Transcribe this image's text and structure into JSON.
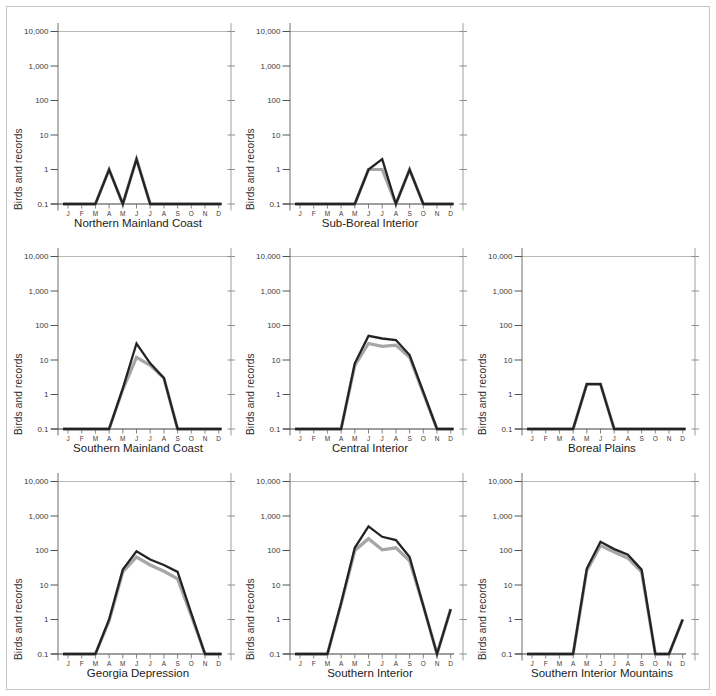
{
  "figure_name": "seasonal-occurrence-panels",
  "colors": {
    "black_line": "#232323",
    "gray_line": "#a6a6a6",
    "axis": "#6f6f6f",
    "right_axis": "#a0a0a0",
    "top_rule": "#b8b8b8",
    "frame_border": "#c6c6c6",
    "tick_text": "#3a3a3a"
  },
  "chart_data": {
    "type": "line",
    "yscale": "log",
    "ylim": [
      0.1,
      10000
    ],
    "ylabel": "Birds and records",
    "xlabel": "",
    "categories": [
      "J",
      "F",
      "M",
      "A",
      "M",
      "J",
      "J",
      "A",
      "S",
      "O",
      "N",
      "D"
    ],
    "ytick_labels": [
      "10,000",
      "1,000",
      "100",
      "10",
      "1",
      "0.1"
    ],
    "ytick_values": [
      10000,
      1000,
      100,
      10,
      1,
      0.1
    ],
    "grid": "off",
    "legend": "none",
    "charts": [
      {
        "title": "Northern Mainland Coast",
        "grid_pos": {
          "row": 1,
          "col": 1
        },
        "series": [
          {
            "name": "gray-series",
            "color": "#a6a6a6",
            "values": [
              0.1,
              0.1,
              0.1,
              1,
              0.1,
              2,
              0.1,
              0.1,
              0.1,
              0.1,
              0.1,
              0.1
            ]
          },
          {
            "name": "black-series",
            "color": "#232323",
            "values": [
              0.1,
              0.1,
              0.1,
              1,
              0.1,
              2,
              0.1,
              0.1,
              0.1,
              0.1,
              0.1,
              0.1
            ]
          }
        ]
      },
      {
        "title": "Sub-Boreal Interior",
        "grid_pos": {
          "row": 1,
          "col": 2
        },
        "series": [
          {
            "name": "gray-series",
            "color": "#a6a6a6",
            "values": [
              0.1,
              0.1,
              0.1,
              0.1,
              0.1,
              1,
              1,
              0.1,
              1,
              0.1,
              0.1,
              0.1
            ]
          },
          {
            "name": "black-series",
            "color": "#232323",
            "values": [
              0.1,
              0.1,
              0.1,
              0.1,
              0.1,
              1,
              2,
              0.1,
              1,
              0.1,
              0.1,
              0.1
            ]
          }
        ]
      },
      {
        "title": "Southern Mainland Coast",
        "grid_pos": {
          "row": 2,
          "col": 1
        },
        "series": [
          {
            "name": "gray-series",
            "color": "#a6a6a6",
            "values": [
              0.1,
              0.1,
              0.1,
              0.1,
              1.4,
              12,
              7,
              3,
              0.1,
              0.1,
              0.1,
              0.1
            ]
          },
          {
            "name": "black-series",
            "color": "#232323",
            "values": [
              0.1,
              0.1,
              0.1,
              0.1,
              1.5,
              30,
              8,
              3,
              0.1,
              0.1,
              0.1,
              0.1
            ]
          }
        ]
      },
      {
        "title": "Central Interior",
        "grid_pos": {
          "row": 2,
          "col": 2
        },
        "series": [
          {
            "name": "gray-series",
            "color": "#a6a6a6",
            "values": [
              0.1,
              0.1,
              0.1,
              0.1,
              7,
              30,
              25,
              27,
              12,
              1.1,
              0.1,
              0.1
            ]
          },
          {
            "name": "black-series",
            "color": "#232323",
            "values": [
              0.1,
              0.1,
              0.1,
              0.1,
              8,
              50,
              42,
              38,
              14,
              1.2,
              0.1,
              0.1
            ]
          }
        ]
      },
      {
        "title": "Boreal Plains",
        "grid_pos": {
          "row": 2,
          "col": 3
        },
        "series": [
          {
            "name": "gray-series",
            "color": "#a6a6a6",
            "values": [
              0.1,
              0.1,
              0.1,
              0.1,
              2,
              2,
              0.1,
              0.1,
              0.1,
              0.1,
              0.1,
              0.1
            ]
          },
          {
            "name": "black-series",
            "color": "#232323",
            "values": [
              0.1,
              0.1,
              0.1,
              0.1,
              2,
              2,
              0.1,
              0.1,
              0.1,
              0.1,
              0.1,
              0.1
            ]
          }
        ]
      },
      {
        "title": "Georgia Depression",
        "grid_pos": {
          "row": 3,
          "col": 1
        },
        "series": [
          {
            "name": "gray-series",
            "color": "#a6a6a6",
            "values": [
              0.1,
              0.1,
              0.1,
              0.9,
              24,
              65,
              38,
              25,
              15,
              1.3,
              0.1,
              0.1
            ]
          },
          {
            "name": "black-series",
            "color": "#232323",
            "values": [
              0.1,
              0.1,
              0.1,
              1,
              28,
              95,
              55,
              38,
              24,
              1.5,
              0.1,
              0.1
            ]
          }
        ]
      },
      {
        "title": "Southern Interior",
        "grid_pos": {
          "row": 3,
          "col": 2
        },
        "series": [
          {
            "name": "gray-series",
            "color": "#a6a6a6",
            "values": [
              0.1,
              0.1,
              0.1,
              2.8,
              100,
              220,
              105,
              120,
              50,
              2.5,
              0.1,
              2
            ]
          },
          {
            "name": "black-series",
            "color": "#232323",
            "values": [
              0.1,
              0.1,
              0.1,
              3,
              120,
              500,
              250,
              200,
              65,
              2.5,
              0.1,
              2
            ]
          }
        ]
      },
      {
        "title": "Southern Interior Mountains",
        "grid_pos": {
          "row": 3,
          "col": 3
        },
        "series": [
          {
            "name": "gray-series",
            "color": "#a6a6a6",
            "values": [
              0.1,
              0.1,
              0.1,
              0.1,
              26,
              140,
              90,
              60,
              24,
              0.1,
              0.1,
              1
            ]
          },
          {
            "name": "black-series",
            "color": "#232323",
            "values": [
              0.1,
              0.1,
              0.1,
              0.1,
              30,
              180,
              110,
              75,
              28,
              0.1,
              0.1,
              1
            ]
          }
        ]
      }
    ]
  }
}
